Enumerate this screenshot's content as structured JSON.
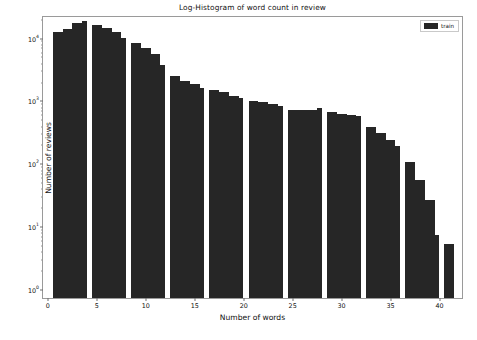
{
  "chart_data": {
    "type": "bar",
    "title": "Log-Histogram of word count in review",
    "xlabel": "Number of words",
    "ylabel": "Number of reviews",
    "yscale": "log",
    "grid": false,
    "legend": {
      "position": "upper right",
      "entries": [
        {
          "name": "train",
          "color": "#262626"
        }
      ]
    },
    "xlim": [
      -0.5,
      42.5
    ],
    "ylim": [
      0.7,
      22000
    ],
    "xticks": [
      0,
      5,
      10,
      15,
      20,
      25,
      30,
      35,
      40
    ],
    "xticklabels": [
      "0",
      "5",
      "10",
      "15",
      "20",
      "25",
      "30",
      "35",
      "40"
    ],
    "yticks": [
      1,
      10,
      100,
      1000,
      10000
    ],
    "yticklabels": [
      "10⁰",
      "10¹",
      "10²",
      "10³",
      "10⁴"
    ],
    "ytick_exponents": [
      "0",
      "1",
      "2",
      "3",
      "4"
    ],
    "categories": [
      1,
      2,
      3,
      4,
      5,
      6,
      7,
      8,
      9,
      10,
      11,
      12,
      13,
      14,
      15,
      16,
      17,
      18,
      19,
      20,
      21,
      22,
      23,
      24,
      25,
      26,
      27,
      28,
      29,
      30,
      31,
      32,
      33,
      34,
      35,
      36,
      37,
      38,
      39,
      40,
      41
    ],
    "values": [
      12000,
      13000,
      16500,
      17500,
      15000,
      13500,
      12000,
      9500,
      8000,
      6500,
      5200,
      3500,
      2400,
      2000,
      1750,
      1500,
      1400,
      1300,
      1150,
      1050,
      930,
      900,
      860,
      800,
      690,
      670,
      680,
      740,
      640,
      580,
      560,
      540,
      360,
      290,
      230,
      180,
      100,
      52,
      25,
      7,
      5
    ],
    "group_size": 4,
    "series": [
      {
        "name": "train",
        "color": "#262626",
        "values": [
          12000,
          13000,
          16500,
          17500,
          15000,
          13500,
          12000,
          9500,
          8000,
          6500,
          5200,
          3500,
          2400,
          2000,
          1750,
          1500,
          1400,
          1300,
          1150,
          1050,
          930,
          900,
          860,
          800,
          690,
          670,
          680,
          740,
          640,
          580,
          560,
          540,
          360,
          290,
          230,
          180,
          100,
          52,
          25,
          7,
          5
        ]
      }
    ]
  },
  "caption": {
    "text": ""
  }
}
